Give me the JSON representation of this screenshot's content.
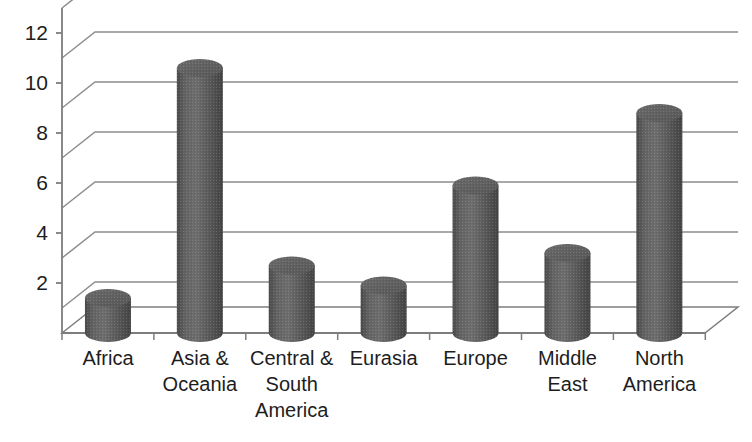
{
  "chart_data": {
    "type": "bar",
    "title": "",
    "subtitle": "",
    "xlabel": "",
    "ylabel": "",
    "categories": [
      "Africa",
      "Asia & Oceania",
      "Central & South America",
      "Eurasia",
      "Europe",
      "Middle East",
      "North America"
    ],
    "values": [
      1.4,
      10.6,
      2.7,
      1.9,
      5.9,
      3.2,
      8.8
    ],
    "ylim": [
      0,
      13
    ],
    "ytick_labels": [
      "12",
      "10",
      "8",
      "6",
      "4",
      "2"
    ],
    "ytick_values": [
      12,
      10,
      8,
      6,
      4,
      2
    ],
    "gridline_values": [
      13,
      11,
      9,
      7,
      5,
      3,
      1
    ],
    "grid": true,
    "legend": "none",
    "style": "3d-cylinder",
    "series": [
      {
        "name": "",
        "values": [
          1.4,
          10.6,
          2.7,
          1.9,
          5.9,
          3.2,
          8.8
        ]
      }
    ],
    "colors": {
      "bar_fill": "#5e5e5e",
      "bar_light": "#6f6f6f",
      "bar_dark": "#3f3f3f",
      "bar_top": "#656565",
      "gridline": "#8d8d8d",
      "axis": "#7d7d7d",
      "background": "#ffffff",
      "text": "#1d1d1d"
    }
  },
  "geometry": {
    "origin_x": 62,
    "baseline_y": 333,
    "px_per_unit": 25,
    "plot_right_x": 705,
    "depth_dx": 33,
    "depth_dy": -26,
    "bar_width": 46,
    "slot_width": 91.9
  }
}
